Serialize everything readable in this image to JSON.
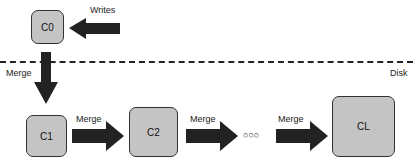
{
  "diagram": {
    "components": [
      {
        "id": "c0",
        "label": "C0",
        "location": "memory"
      },
      {
        "id": "c1",
        "label": "C1",
        "location": "disk"
      },
      {
        "id": "c2",
        "label": "C2",
        "location": "disk"
      },
      {
        "id": "cl",
        "label": "CL",
        "location": "disk"
      }
    ],
    "ellipsis": "○○○",
    "arrows": {
      "writes": "Writes",
      "merge_down": "Merge",
      "merge_c1_c2": "Merge",
      "merge_c2_dots": "Merge",
      "merge_dots_cl": "Merge"
    },
    "boundary_label": "Disk",
    "colors": {
      "box_fill": "#c4c4c4",
      "arrow": "#222222",
      "border": "#333333"
    }
  }
}
